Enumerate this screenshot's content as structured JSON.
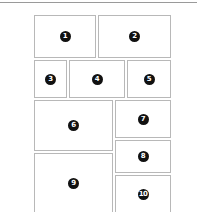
{
  "diagram": {
    "type": "panel-layout",
    "panels": [
      {
        "label": "1",
        "x": 34,
        "y": 15,
        "w": 62,
        "h": 43
      },
      {
        "label": "2",
        "x": 98,
        "y": 15,
        "w": 73,
        "h": 43
      },
      {
        "label": "3",
        "x": 34,
        "y": 60,
        "w": 33,
        "h": 38
      },
      {
        "label": "4",
        "x": 69,
        "y": 60,
        "w": 56,
        "h": 38
      },
      {
        "label": "5",
        "x": 127,
        "y": 60,
        "w": 44,
        "h": 38
      },
      {
        "label": "6",
        "x": 34,
        "y": 100,
        "w": 79,
        "h": 51
      },
      {
        "label": "7",
        "x": 115,
        "y": 100,
        "w": 56,
        "h": 38
      },
      {
        "label": "8",
        "x": 115,
        "y": 140,
        "w": 56,
        "h": 33
      },
      {
        "label": "9",
        "x": 34,
        "y": 153,
        "w": 79,
        "h": 60
      },
      {
        "label": "10",
        "x": 115,
        "y": 175,
        "w": 56,
        "h": 38
      }
    ],
    "colors": {
      "border": "#b8b8b8",
      "badge": "#111111",
      "topline": "#9a9a9a"
    }
  }
}
